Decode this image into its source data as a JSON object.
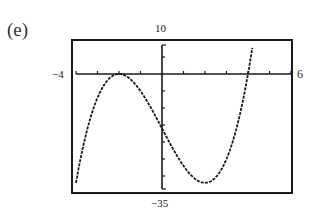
{
  "figure": {
    "part_label": "(e)",
    "window_labels": {
      "xmin": "−4",
      "xmax": "6",
      "ymin": "−35",
      "ymax": "10"
    },
    "colors": {
      "frame": "#1a1a1a",
      "axes": "#1a1a1a",
      "curve": "#1a1a1a",
      "background": "#ffffff"
    }
  },
  "chart_data": {
    "type": "line",
    "title": "(e)",
    "xlabel": "",
    "ylabel": "",
    "xlim": [
      -4,
      6
    ],
    "ylim": [
      -35,
      10
    ],
    "xscale_ticks": 1,
    "yscale_ticks": 5,
    "grid": false,
    "legend": null,
    "function": "f(x) = (x+2)^2 (x-4) = x^3 - 12x - 16",
    "annotations": [
      "-4 at left end of x-axis",
      "6 at right end of x-axis",
      "10 at top of y-axis",
      "-35 at bottom of y-axis"
    ],
    "series": [
      {
        "name": "f(x)",
        "x": [
          -4,
          -3.75,
          -3.5,
          -3.25,
          -3,
          -2.75,
          -2.5,
          -2.25,
          -2,
          -1.75,
          -1.5,
          -1.25,
          -1,
          -0.75,
          -0.5,
          -0.25,
          0,
          0.25,
          0.5,
          0.75,
          1,
          1.25,
          1.5,
          1.75,
          2,
          2.25,
          2.5,
          2.75,
          3,
          3.25,
          3.5,
          3.75,
          4,
          4.1,
          4.2,
          4.23
        ],
        "y": [
          -32,
          -21.73,
          -13.88,
          -8.33,
          -7,
          -3.8,
          -1.63,
          -0.39,
          0,
          -0.36,
          -1.38,
          -2.95,
          -5,
          -7.42,
          -10.13,
          -13.02,
          -16,
          -18.98,
          -21.88,
          -24.58,
          -27,
          -29.05,
          -30.63,
          -31.64,
          -32,
          -31.61,
          -30.38,
          -28.2,
          -25,
          -20.67,
          -15.13,
          -8.27,
          0,
          0.97,
          1.97,
          2.2
        ]
      }
    ]
  }
}
